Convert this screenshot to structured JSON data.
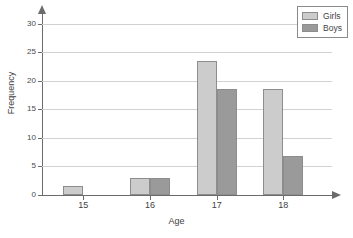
{
  "chart_data": {
    "type": "bar",
    "title": "",
    "subtitle": "",
    "xlabel": "Age",
    "ylabel": "Frequency",
    "categories": [
      "15",
      "16",
      "17",
      "18"
    ],
    "series": [
      {
        "name": "Girls",
        "color": "#cccccc",
        "values": [
          1.5,
          3,
          23.5,
          18.5
        ]
      },
      {
        "name": "Boys",
        "color": "#9a9a9a",
        "values": [
          0,
          3,
          18.5,
          6.8
        ]
      }
    ],
    "ylim": [
      0,
      31
    ],
    "xlim": [
      14.5,
      18.9
    ],
    "yticks": [
      0,
      5,
      10,
      15,
      20,
      25,
      30
    ],
    "ytick_labels": [
      "0",
      "5",
      "10",
      "15",
      "20",
      "25",
      "30"
    ],
    "xtick_labels": [
      "15",
      "16",
      "17",
      "18"
    ],
    "grid": true,
    "grid_axis": "y",
    "legend_position": "top-right",
    "legend_entries": [
      "Girls",
      "Boys"
    ]
  },
  "legend": {
    "items": [
      {
        "label": "Girls",
        "swatch": "legend-swatch-girls"
      },
      {
        "label": "Boys",
        "swatch": "legend-swatch-boys"
      }
    ]
  },
  "axes": {
    "x_title": "Age",
    "y_title": "Frequency"
  }
}
